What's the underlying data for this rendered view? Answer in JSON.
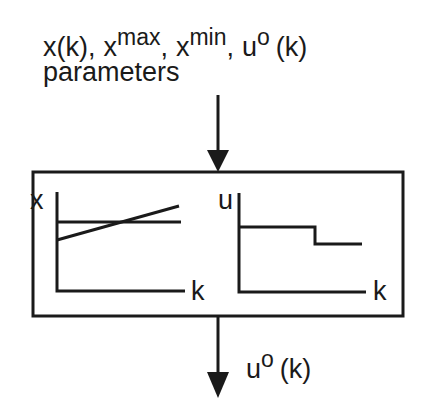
{
  "diagram": {
    "inputs": {
      "line1": {
        "x_k": "x(k),",
        "xmax_base": "x",
        "xmax_sup": "max",
        "xmin_base": "x",
        "xmin_sup": "min",
        "u0_base": "u",
        "u0_sup": "o",
        "u0_arg": "(k)",
        "comma1": ",",
        "comma2": ","
      },
      "line2": "parameters"
    },
    "block": {
      "left_plot": {
        "y_label": "x",
        "x_label": "k",
        "series": [
          "x(k) trajectory (rising line)",
          "constant bound (horizontal line)"
        ]
      },
      "right_plot": {
        "y_label": "u",
        "x_label": "k",
        "series": [
          "u(k) step profile (decreasing step)"
        ]
      }
    },
    "output": {
      "base": "u",
      "sup": "o",
      "arg": "(k)"
    },
    "colors": {
      "stroke": "#1a1a1a",
      "background": "#ffffff"
    }
  }
}
